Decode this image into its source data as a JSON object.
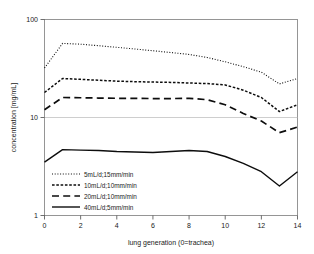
{
  "chart_data": {
    "type": "line",
    "title": "",
    "xlabel": "lung generation (0=trachea)",
    "ylabel": "concentration [mg/mL]",
    "yscale": "log",
    "ylim": [
      1,
      100
    ],
    "xlim": [
      0,
      14
    ],
    "y_ticks": [
      1,
      10,
      100
    ],
    "y_tick_labels": [
      "1",
      "10",
      "100"
    ],
    "x_ticks": [
      0,
      2,
      4,
      6,
      8,
      10,
      12,
      14
    ],
    "x_tick_labels": [
      "0",
      "2",
      "4",
      "6",
      "8",
      "10",
      "12",
      "14"
    ],
    "grid": "horizontal-at-10",
    "legend_position": "lower-left-inside",
    "x": [
      0,
      1,
      2,
      3,
      4,
      5,
      6,
      7,
      8,
      9,
      10,
      11,
      12,
      13,
      14
    ],
    "series": [
      {
        "name": "5mL/d;15mm/min",
        "style": "dotted",
        "color": "#0d0d0d",
        "values": [
          32,
          57,
          56,
          54,
          52,
          50,
          48,
          46,
          44,
          41,
          37,
          33,
          29,
          22,
          25
        ]
      },
      {
        "name": "10mL/d;10mm/min",
        "style": "densely-dashed",
        "color": "#0d0d0d",
        "values": [
          18,
          25,
          24.5,
          24,
          23.5,
          23.2,
          23,
          22.8,
          22.5,
          22.2,
          21.5,
          19,
          16,
          11.5,
          13.5
        ]
      },
      {
        "name": "20mL/d;10mm/min",
        "style": "long-dashed",
        "color": "#0d0d0d",
        "values": [
          12,
          16,
          15.9,
          15.8,
          15.7,
          15.7,
          15.6,
          15.6,
          15.7,
          15.2,
          13.5,
          11,
          9.2,
          7,
          8
        ]
      },
      {
        "name": "40mL/d;5mm/min",
        "style": "solid",
        "color": "#0d0d0d",
        "values": [
          3.5,
          4.7,
          4.65,
          4.6,
          4.5,
          4.45,
          4.4,
          4.5,
          4.6,
          4.5,
          4.0,
          3.4,
          2.8,
          2.0,
          2.8
        ]
      }
    ]
  },
  "legend": {
    "entries": [
      {
        "label": "5mL/d;15mm/min"
      },
      {
        "label": "10mL/d;10mm/min"
      },
      {
        "label": "20mL/d;10mm/min"
      },
      {
        "label": "40mL/d;5mm/min"
      }
    ]
  },
  "axes": {
    "y_title": "concentration [mg/mL]",
    "x_title": "lung generation (0=trachea)",
    "y_tick_top": "100",
    "y_tick_mid": "10",
    "y_tick_bottom": "1",
    "x_tick_0": "0",
    "x_tick_2": "2",
    "x_tick_4": "4",
    "x_tick_6": "6",
    "x_tick_8": "8",
    "x_tick_10": "10",
    "x_tick_12": "12",
    "x_tick_14": "14"
  }
}
